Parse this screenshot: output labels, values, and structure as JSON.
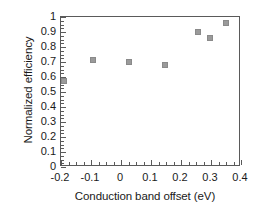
{
  "chart_data": {
    "type": "scatter",
    "title": "",
    "xlabel": "Conduction band offset (eV)",
    "ylabel": "Normalized efficiency",
    "xlim": [
      -0.2,
      0.4
    ],
    "ylim": [
      0,
      1
    ],
    "xticks": [
      -0.2,
      -0.1,
      0,
      0.1,
      0.2,
      0.3,
      0.4
    ],
    "xtick_labels": [
      "-0.2",
      "-0.1",
      "0",
      "0.1",
      "0.2",
      "0.3",
      "0.4"
    ],
    "yticks": [
      0,
      0.1,
      0.2,
      0.3,
      0.4,
      0.5,
      0.6,
      0.7,
      0.8,
      0.9,
      1
    ],
    "ytick_labels": [
      "0",
      "0.1",
      "0.2",
      "0.3",
      "0.4",
      "0.5",
      "0.6",
      "0.7",
      "0.8",
      "0.9",
      "1"
    ],
    "x_minor_tick_step": 0.025,
    "y_minor_tick_step": 0.025,
    "grid": false,
    "legend": null,
    "marker": {
      "shape": "square",
      "color": "#9a9a9a",
      "size_px": 6
    },
    "series": [
      {
        "name": "Normalized efficiency",
        "points": [
          {
            "x": -0.19,
            "y": 0.575
          },
          {
            "x": -0.093,
            "y": 0.715
          },
          {
            "x": 0.027,
            "y": 0.7
          },
          {
            "x": 0.148,
            "y": 0.68
          },
          {
            "x": 0.257,
            "y": 0.9
          },
          {
            "x": 0.297,
            "y": 0.86
          },
          {
            "x": 0.35,
            "y": 0.96
          }
        ]
      }
    ]
  },
  "axis_color": "#5a5a5a",
  "text_color": "#1a1a1a",
  "background": "#ffffff"
}
